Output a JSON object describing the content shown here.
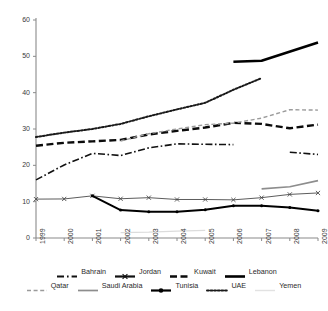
{
  "chart_data": {
    "type": "line",
    "title": "",
    "xlabel": "",
    "ylabel": "",
    "x": [
      1999,
      2000,
      2001,
      2002,
      2003,
      2004,
      2005,
      2006,
      2007,
      2008,
      2009
    ],
    "xticklabels": [
      "1999",
      "2000",
      "2001",
      "2002",
      "2003",
      "2004",
      "2005",
      "2006",
      "2007",
      "2008",
      "2009"
    ],
    "yticklabels": [
      "0",
      "10",
      "20",
      "30",
      "40",
      "50",
      "60"
    ],
    "yticks": [
      0,
      10,
      20,
      30,
      40,
      50,
      60
    ],
    "ylim": [
      0,
      60
    ],
    "xlim": [
      1999,
      2009
    ],
    "grid": false,
    "legend_position": "bottom",
    "series": [
      {
        "name": "Bahrain",
        "style": "dash-dot",
        "color": "#111111",
        "width": 1.6,
        "marker": "none",
        "x": [
          1999,
          2000,
          2001,
          2002,
          2003,
          2004,
          2005,
          2006,
          2007,
          2008,
          2009
        ],
        "values": [
          16.0,
          20.1,
          23.3,
          22.7,
          24.8,
          25.9,
          25.8,
          25.7,
          null,
          23.6,
          23.0
        ]
      },
      {
        "name": "Jordan",
        "style": "solid-thin",
        "color": "#4a4a4a",
        "width": 0.9,
        "marker": "x",
        "x": [
          1999,
          2000,
          2001,
          2002,
          2003,
          2004,
          2005,
          2006,
          2007,
          2008,
          2009
        ],
        "values": [
          10.7,
          10.75,
          11.6,
          10.8,
          11.1,
          10.6,
          10.6,
          10.5,
          11.1,
          12.0,
          12.4
        ]
      },
      {
        "name": "Kuwait",
        "style": "dashed",
        "color": "#0b0b0b",
        "width": 2.4,
        "marker": "none",
        "x": [
          1999,
          2000,
          2001,
          2002,
          2003,
          2004,
          2005,
          2006,
          2007,
          2008,
          2009
        ],
        "values": [
          25.4,
          26.2,
          26.6,
          27.0,
          28.5,
          29.5,
          30.4,
          31.7,
          31.4,
          30.2,
          31.2
        ]
      },
      {
        "name": "Lebanon",
        "style": "solid-thick",
        "color": "#000000",
        "width": 2.6,
        "marker": "none",
        "x": [
          2006,
          2007,
          2009
        ],
        "values": [
          48.5,
          48.8,
          53.8
        ]
      },
      {
        "name": "Qatar",
        "style": "dashed-light",
        "color": "#9b9b9b",
        "width": 1.4,
        "marker": "none",
        "x": [
          2002,
          2003,
          2004,
          2005,
          2006,
          2007,
          2008,
          2009
        ],
        "values": [
          26.7,
          28.7,
          30.0,
          31.2,
          31.6,
          33.0,
          35.3,
          35.2
        ]
      },
      {
        "name": "Saudi Arabia",
        "style": "solid-light",
        "color": "#8d8d8d",
        "width": 1.7,
        "marker": "none",
        "x": [
          2007,
          2008,
          2009
        ],
        "values": [
          13.5,
          14.1,
          15.8
        ]
      },
      {
        "name": "Tunisia",
        "style": "solid-marker",
        "color": "#000000",
        "width": 2.0,
        "marker": "dot",
        "x": [
          2001,
          2002,
          2003,
          2004,
          2005,
          2006,
          2007,
          2008,
          2009
        ],
        "values": [
          11.6,
          7.7,
          7.2,
          7.2,
          7.8,
          8.9,
          8.9,
          8.4,
          7.5
        ]
      },
      {
        "name": "UAE",
        "style": "dotted",
        "color": "#1a1a1a",
        "width": 2.0,
        "marker": "none",
        "x": [
          1999,
          2000,
          2001,
          2002,
          2003,
          2004,
          2005,
          2006,
          2007
        ],
        "values": [
          27.8,
          29.0,
          30.0,
          31.4,
          33.5,
          35.4,
          37.2,
          40.8,
          44.0
        ]
      },
      {
        "name": "Yemen",
        "style": "solid-faint",
        "color": "#dcdcdc",
        "width": 1.3,
        "marker": "none",
        "x": [
          2002,
          2003,
          2004,
          2005
        ],
        "values": [
          1.5,
          1.6,
          1.9,
          2.1
        ]
      }
    ]
  },
  "legend": {
    "rows": [
      [
        {
          "label": "Bahrain",
          "key": "dash-dot"
        },
        {
          "label": "Jordan",
          "key": "solid-marker-x"
        },
        {
          "label": "Kuwait",
          "key": "dashed"
        },
        {
          "label": "Lebanon",
          "key": "solid-thick"
        }
      ],
      [
        {
          "label": "Qatar",
          "key": "dashed-light"
        },
        {
          "label": "Saudi Arabia",
          "key": "solid-light"
        },
        {
          "label": "Tunisia",
          "key": "solid-marker"
        },
        {
          "label": "UAE",
          "key": "dotted"
        },
        {
          "label": "Yemen",
          "key": "solid-faint"
        }
      ]
    ]
  },
  "axis": {
    "color": "#8a8a8a"
  }
}
